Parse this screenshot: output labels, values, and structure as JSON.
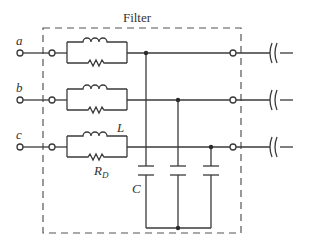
{
  "diagram": {
    "title": "Filter",
    "phases": [
      {
        "label": "a"
      },
      {
        "label": "b"
      },
      {
        "label": "c"
      }
    ],
    "components": {
      "inductor_label": "L",
      "resistor_label": "R",
      "resistor_subscript": "D",
      "capacitor_label": "C"
    },
    "colors": {
      "wire": "#3a3a3a",
      "border": "#555555",
      "background": "#ffffff"
    }
  }
}
